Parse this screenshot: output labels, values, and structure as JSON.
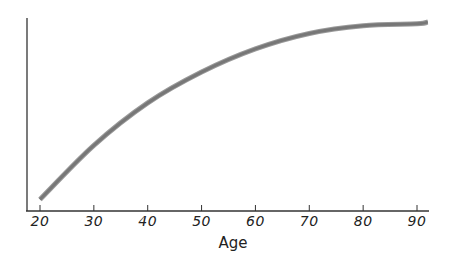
{
  "chart_data": {
    "type": "line",
    "title": "",
    "xlabel": "Age",
    "ylabel": "",
    "x_ticks": [
      20,
      30,
      40,
      50,
      60,
      70,
      80,
      90
    ],
    "xlim": [
      17,
      93
    ],
    "ylim": [
      0,
      100
    ],
    "grid": false,
    "legend": null,
    "series": [
      {
        "name": "curve",
        "color": "#777777",
        "x": [
          20,
          30,
          40,
          50,
          60,
          70,
          80,
          90,
          92
        ],
        "y": [
          6,
          34,
          56,
          72,
          84,
          92,
          96,
          97,
          98
        ]
      }
    ]
  },
  "axis": {
    "xlabel": "Age",
    "tick_labels": [
      "20",
      "30",
      "40",
      "50",
      "60",
      "70",
      "80",
      "90"
    ]
  }
}
